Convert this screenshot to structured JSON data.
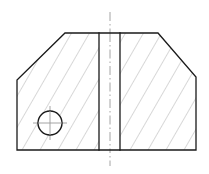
{
  "document": {
    "title": "Sectional View - Chamfered Block with Slot and Bore",
    "drawing_type": "engineering-section-view",
    "background_color": "#ffffff",
    "canvas": {
      "width": 209,
      "height": 174
    }
  },
  "styles": {
    "outline_color": "#1a1a1a",
    "outline_width": 1.3,
    "hatch_color": "#8c8c8c",
    "hatch_width": 0.7,
    "centerline_color": "#9a9a9a",
    "centerline_width": 0.9,
    "circle_color": "#1a1a1a",
    "circle_width": 1.4,
    "slot_edge_color": "#1a1a1a",
    "slot_fill": "#ffffff"
  },
  "geometry": {
    "outline_label": "part-outline",
    "outline_points": "17,150 17,80 65,33 158,33 196,77 196,150",
    "outline_closed": true,
    "vertices": [
      {
        "name": "bottom-left-corner",
        "x": 17,
        "y": 150
      },
      {
        "name": "left-edge-top",
        "x": 17,
        "y": 80
      },
      {
        "name": "left-chamfer-top",
        "x": 65,
        "y": 33
      },
      {
        "name": "top-edge-right",
        "x": 158,
        "y": 33
      },
      {
        "name": "right-chamfer-bottom",
        "x": 196,
        "y": 77
      },
      {
        "name": "bottom-right-corner",
        "x": 196,
        "y": 150
      }
    ],
    "slot": {
      "name": "central-vertical-slot",
      "x": 99,
      "y": 33,
      "width": 21,
      "height": 117,
      "left_edge_x": 99,
      "right_edge_x": 120,
      "top_y": 33,
      "bottom_y": 150
    },
    "bore": {
      "name": "circular-bore",
      "center_x": 50,
      "center_y": 123,
      "radius": 12,
      "crosshair_overrun": 5
    },
    "vertical_centerline": {
      "name": "part-vertical-centerline",
      "x": 110,
      "y_top": 12,
      "y_bottom": 166
    },
    "hatch": {
      "name": "section-hatch",
      "angle_degrees": -30,
      "spacing": 9.0,
      "direction": "down-right"
    }
  },
  "annotations": {
    "has_dimensions": false,
    "has_text_labels": false,
    "visible_text": ""
  }
}
